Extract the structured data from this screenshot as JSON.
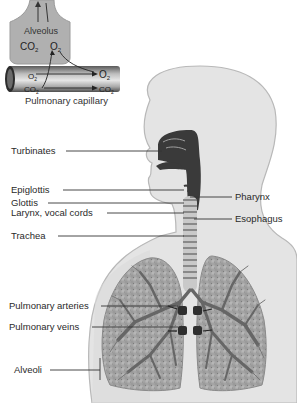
{
  "diagram": {
    "inset": {
      "alveolus_label": "Alveolus",
      "capillary_label": "Pulmonary capillary",
      "alveolus_gases": [
        {
          "base": "CO",
          "sub": "2"
        },
        {
          "base": "O",
          "sub": "2"
        }
      ],
      "capillary_gases_in": [
        {
          "base": "O",
          "sub": "2"
        },
        {
          "base": "CO",
          "sub": "2"
        }
      ],
      "capillary_gases_out": [
        {
          "base": "O",
          "sub": "2"
        },
        {
          "base": "CO",
          "sub": "2"
        }
      ]
    },
    "labels_left": [
      {
        "text": "Turbinates"
      },
      {
        "text": "Epiglottis"
      },
      {
        "text": "Glottis"
      },
      {
        "text": "Larynx, vocal cords"
      },
      {
        "text": "Trachea"
      },
      {
        "text": "Pulmonary arteries"
      },
      {
        "text": "Pulmonary veins"
      },
      {
        "text": "Alveoli"
      }
    ],
    "labels_right": [
      {
        "text": "Pharynx"
      },
      {
        "text": "Esophagus"
      }
    ],
    "colors": {
      "body_fill": "#e4e4e4",
      "body_outline": "#b8b8b8",
      "airway_dark": "#3a3a3a",
      "lung_fill": "#a9a9a9",
      "bronchi": "#6a6a6a",
      "capillary": "#7a7a7a",
      "alveolus_fill": "#b0b0b0",
      "leader_line": "#333333"
    }
  }
}
